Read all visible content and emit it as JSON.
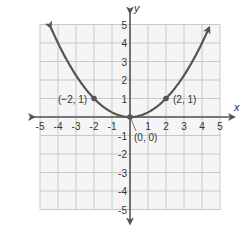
{
  "chart_data": {
    "type": "line",
    "title": "",
    "xlabel": "x",
    "ylabel": "y",
    "xlim": [
      -5,
      5
    ],
    "ylim": [
      -5,
      5
    ],
    "grid": true,
    "x_ticks": [
      -5,
      -4,
      -3,
      -2,
      -1,
      1,
      2,
      3,
      4,
      5
    ],
    "y_ticks": [
      5,
      4,
      3,
      2,
      1,
      -1,
      -2,
      -3,
      -4,
      -5
    ],
    "series": [
      {
        "name": "parabola",
        "equation": "y = x^2 / 4",
        "x": [
          -4.4,
          -4,
          -3,
          -2,
          -1,
          0,
          1,
          2,
          3,
          4,
          4.4
        ],
        "values": [
          4.84,
          4,
          2.25,
          1,
          0.25,
          0,
          0.25,
          1,
          2.25,
          4,
          4.84
        ],
        "arrows_at_ends": true,
        "color": "#555555"
      }
    ],
    "points": [
      {
        "x": -2,
        "y": 1,
        "label": "(−2, 1)"
      },
      {
        "x": 0,
        "y": 0,
        "label": "(0, 0)"
      },
      {
        "x": 2,
        "y": 1,
        "label": "(2, 1)"
      }
    ]
  },
  "labels": {
    "x_axis": "x",
    "y_axis": "y",
    "x_ticks": [
      "-5",
      "-4",
      "-3",
      "-2",
      "-1",
      "1",
      "2",
      "3",
      "4",
      "5"
    ],
    "y_ticks": [
      "5",
      "4",
      "3",
      "2",
      "1",
      "-1",
      "-2",
      "-3",
      "-4",
      "-5"
    ],
    "point_neg2": "(−2, 1)",
    "point_origin": "(0, 0)",
    "point_pos2": "(2, 1)"
  },
  "colors": {
    "curve": "#555555",
    "grid": "#c8c8c8",
    "grid_bg": "#f5f5f5",
    "axis": "#555555",
    "text": "#333333"
  }
}
